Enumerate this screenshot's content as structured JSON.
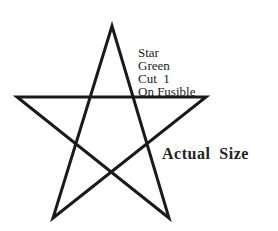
{
  "shape": {
    "name": "Star",
    "stroke": "#1a1a1a"
  },
  "label_lines": [
    "Star",
    "Green",
    "Cut  1",
    "On Fusible"
  ],
  "caption": "Actual  Size"
}
